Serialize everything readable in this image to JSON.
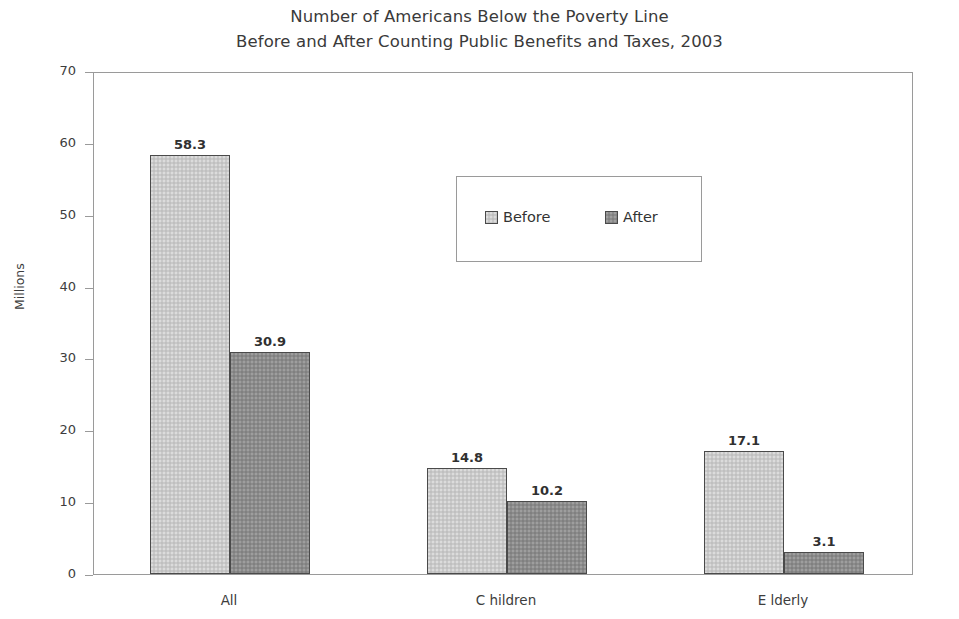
{
  "chart_data": {
    "type": "bar",
    "title": "Number of Americans Below the Poverty Line Before and After Counting Public Benefits and Taxes, 2003",
    "title_lines": [
      "Number of Americans Below the Poverty Line",
      "Before and After Counting Public Benefits and Taxes, 2003"
    ],
    "categories": [
      "All",
      "C hildren",
      "E lderly"
    ],
    "series": [
      {
        "name": "Before",
        "values": [
          58.3,
          14.8,
          17.1
        ],
        "color": "#c9c9c9"
      },
      {
        "name": "After",
        "values": [
          30.9,
          10.2,
          3.1
        ],
        "color": "#8b8b8b"
      }
    ],
    "xlabel": "",
    "ylabel": "Millions",
    "ylim": [
      0,
      70
    ],
    "ytick_values": [
      70,
      60,
      50,
      40,
      30,
      20,
      10,
      0
    ],
    "ytick_labels": [
      "70",
      "60",
      "50",
      "40",
      "30",
      "20",
      "10",
      "0"
    ],
    "grid": false,
    "legend_position": "inside-upper-center",
    "bar_value_labels": [
      "58.3",
      "30.9",
      "14.8",
      "10.2",
      "17.1",
      "3.1"
    ],
    "frame_color": "#9a9a9a",
    "bar_border_color": "#4a4a4a",
    "text_color": "#3d3d3d"
  },
  "legend": {
    "entries": [
      {
        "label": "Before",
        "swatch": "before"
      },
      {
        "label": "After",
        "swatch": "after"
      }
    ]
  }
}
